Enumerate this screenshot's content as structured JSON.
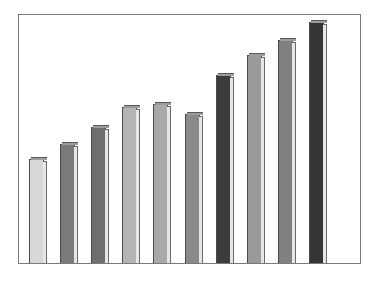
{
  "chart_data": {
    "type": "bar",
    "title": "",
    "xlabel": "",
    "ylabel": "",
    "categories": [
      "1",
      "2",
      "3",
      "4",
      "5",
      "6",
      "7",
      "8",
      "9",
      "10"
    ],
    "values": [
      42,
      48,
      55,
      63,
      64,
      60,
      76,
      84,
      90,
      97
    ],
    "ylim": [
      0,
      100
    ],
    "grid": false,
    "legend": null,
    "bar_colors": [
      "#d8d8d8",
      "#7a7a7a",
      "#6e6e6e",
      "#b4b4b4",
      "#a8a8a8",
      "#8a8a8a",
      "#3c3c3c",
      "#9a9a9a",
      "#808080",
      "#353535"
    ],
    "style": "3d-beveled bars, no tick labels, plain frame"
  }
}
